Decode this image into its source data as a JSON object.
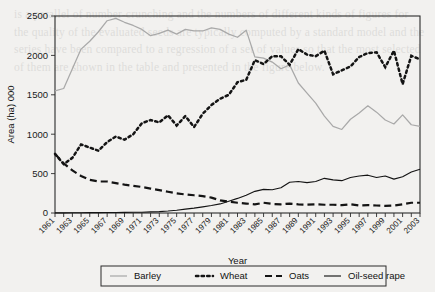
{
  "chart_data": {
    "type": "line",
    "title": "",
    "xlabel": "Year",
    "ylabel": "Area (ha) 000",
    "ylim": [
      0,
      2500
    ],
    "ytick_step": 500,
    "yticks": [
      "0",
      "500",
      "1000",
      "1500",
      "2000",
      "2500"
    ],
    "grid": false,
    "legend_position": "bottom",
    "x": [
      1961,
      1962,
      1963,
      1964,
      1965,
      1966,
      1967,
      1968,
      1969,
      1970,
      1971,
      1972,
      1973,
      1974,
      1975,
      1976,
      1977,
      1978,
      1979,
      1980,
      1981,
      1982,
      1983,
      1984,
      1985,
      1986,
      1987,
      1988,
      1989,
      1990,
      1991,
      1992,
      1993,
      1994,
      1995,
      1996,
      1997,
      1998,
      1999,
      2000,
      2001,
      2002,
      2003
    ],
    "xtick_labels": [
      "1961",
      "1963",
      "1965",
      "1967",
      "1969",
      "1971",
      "1973",
      "1975",
      "1977",
      "1979",
      "1981",
      "1983",
      "1985",
      "1987",
      "1989",
      "1991",
      "1993",
      "1995",
      "1997",
      "1999",
      "2001",
      "2003"
    ],
    "series": [
      {
        "name": "Barley",
        "style": "solid-light",
        "color": "#a9a9a9",
        "values": [
          1550,
          1580,
          1830,
          2080,
          2180,
          2300,
          2440,
          2470,
          2420,
          2380,
          2330,
          2250,
          2280,
          2320,
          2270,
          2330,
          2310,
          2310,
          2350,
          2330,
          2270,
          2230,
          2320,
          1980,
          1965,
          1915,
          1830,
          1880,
          1650,
          1520,
          1395,
          1230,
          1100,
          1060,
          1190,
          1270,
          1360,
          1280,
          1180,
          1130,
          1245,
          1120,
          1100
        ]
      },
      {
        "name": "Wheat",
        "style": "dotted",
        "color": "#141414",
        "values": [
          750,
          620,
          700,
          870,
          830,
          790,
          900,
          970,
          930,
          1000,
          1140,
          1180,
          1150,
          1240,
          1110,
          1230,
          1090,
          1260,
          1370,
          1450,
          1500,
          1660,
          1690,
          1940,
          1890,
          1990,
          1990,
          1880,
          2080,
          2010,
          1990,
          2060,
          1760,
          1810,
          1860,
          1980,
          2030,
          2040,
          1850,
          2060,
          1635,
          1995,
          1950
        ]
      },
      {
        "name": "Oats",
        "style": "dashed",
        "color": "#141414",
        "values": [
          750,
          630,
          540,
          470,
          420,
          400,
          400,
          380,
          360,
          345,
          330,
          310,
          290,
          270,
          250,
          235,
          225,
          215,
          195,
          160,
          145,
          130,
          120,
          110,
          130,
          115,
          110,
          120,
          110,
          105,
          110,
          105,
          105,
          100,
          110,
          95,
          100,
          95,
          90,
          95,
          110,
          130,
          130
        ]
      },
      {
        "name": "Oil-seed rape",
        "style": "solid-thin",
        "color": "#141414",
        "values": [
          2,
          2,
          3,
          3,
          4,
          5,
          6,
          7,
          8,
          9,
          10,
          14,
          18,
          25,
          35,
          50,
          62,
          78,
          95,
          115,
          150,
          185,
          225,
          275,
          300,
          295,
          320,
          390,
          400,
          385,
          400,
          440,
          420,
          410,
          450,
          470,
          480,
          450,
          470,
          430,
          460,
          520,
          555
        ]
      }
    ]
  },
  "ghost_text": "is a parallel of number-crunching and the numbers of different kinds of figures for the quality of the evaluated seeds are typically computed by a standard model and the series have been compared to a regression of a set of values so that the most selected of them are shown in the table and presented in the figure below."
}
